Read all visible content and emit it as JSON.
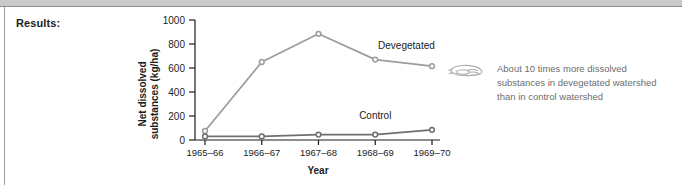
{
  "page": {
    "results_label": "Results:"
  },
  "annotation": {
    "icon": "pointing-hand-icon",
    "text": "About 10 times more dissolved\nsubstances in devegetated watershed\nthan in control watershed"
  },
  "chart_data": {
    "type": "line",
    "title": "",
    "xlabel": "Year",
    "ylabel": "Net dissolved\nsubstances (kg/ha)",
    "ylabel_line1": "Net dissolved",
    "ylabel_line2": "substances (kg/ha)",
    "categories": [
      "1965–66",
      "1966–67",
      "1967–68",
      "1968–69",
      "1969–70"
    ],
    "ylim": [
      0,
      1000
    ],
    "yticks": [
      0,
      200,
      400,
      600,
      800,
      1000
    ],
    "ytick_labels": [
      "0",
      "200",
      "400",
      "600",
      "800",
      "1000"
    ],
    "grid": false,
    "legend": "inline-labels",
    "series": [
      {
        "name": "Devegetated",
        "color": "#9d9d9d",
        "marker": "open-circle",
        "values": [
          75,
          650,
          885,
          670,
          615
        ],
        "label": "Devegetated"
      },
      {
        "name": "Control",
        "color": "#6f6f6f",
        "marker": "open-circle",
        "values": [
          30,
          30,
          45,
          45,
          85
        ],
        "label": "Control"
      }
    ]
  },
  "colors": {
    "axis": "#1c1c1c",
    "text": "#1c1c1c",
    "annotation_text": "#6d6d6d",
    "top_band": "#c9c9c9",
    "devegetated": "#9d9d9d",
    "control": "#6f6f6f"
  }
}
